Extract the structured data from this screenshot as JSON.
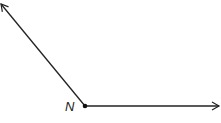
{
  "diagram": {
    "type": "angle",
    "vertex_label": "N",
    "vertex": [
      85,
      106
    ],
    "ray_left_end": [
      1,
      4
    ],
    "ray_right_end": [
      219,
      106
    ],
    "stroke_color": "#222222"
  }
}
